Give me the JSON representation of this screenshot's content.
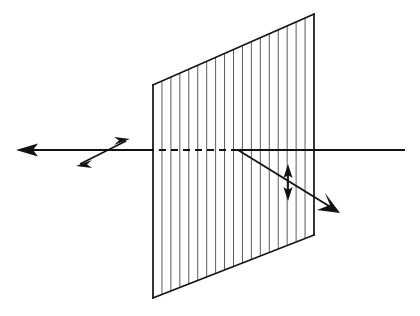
{
  "figure": {
    "background_color": "#ffffff",
    "line_color": "#1a1a1a",
    "slat_color": "#555555",
    "width": 420,
    "height": 316
  },
  "polarizer": {
    "name": "polarizing-filter-panel",
    "description": "Rectangular polarizing sheet drawn in perspective with vertical transmission-axis slats",
    "corners": {
      "top_left": [
        153,
        85
      ],
      "top_right": [
        314,
        14
      ],
      "bottom_right": [
        314,
        235
      ],
      "bottom_left": [
        153,
        298
      ]
    },
    "slat_count": 19,
    "slat_orientation": "vertical",
    "edge_width": 1.6,
    "slat_width": 0.9
  },
  "rays": {
    "incident_beam": {
      "name": "incident-beam-right",
      "label": "incident beam entering from the right",
      "from": [
        405,
        150
      ],
      "to": [
        238,
        150
      ],
      "style": "solid",
      "width": 1.8
    },
    "internal_beam": {
      "name": "internal-beam-dashed",
      "label": "beam path inside the polarizer",
      "from": [
        238,
        150
      ],
      "to": [
        153,
        150
      ],
      "style": "dashed",
      "dash_pattern": "7 5",
      "width": 1.8
    },
    "transmitted_beam": {
      "name": "transmitted-beam-left",
      "label": "transmitted beam exiting to the left",
      "from": [
        153,
        150
      ],
      "to": [
        16,
        150
      ],
      "style": "solid",
      "width": 1.8,
      "arrow_tip": [
        16,
        150
      ],
      "arrow_direction": "left"
    },
    "deflected_beam": {
      "name": "deflected-beam-down-right",
      "label": "deflected beam travelling down and to the right",
      "from": [
        238,
        150
      ],
      "to": [
        340,
        213
      ],
      "style": "solid",
      "width": 1.8,
      "arrow_tip": [
        340,
        213
      ],
      "arrow_direction": "down-right"
    }
  },
  "polarization_markers": {
    "diagonal_double_arrow": {
      "name": "diagonal-polarization-double-arrow",
      "label": "double-headed arrow showing diagonal polarization of transmitted beam",
      "from": [
        76,
        166
      ],
      "to": [
        130,
        139
      ],
      "style": "double-headed",
      "width": 1.8
    },
    "vertical_double_arrow": {
      "name": "vertical-polarization-double-arrow",
      "label": "double-headed arrow showing vertical polarization on the deflected beam",
      "from": [
        288,
        165
      ],
      "to": [
        288,
        200
      ],
      "style": "double-headed",
      "width": 1.8
    }
  },
  "annotations": []
}
